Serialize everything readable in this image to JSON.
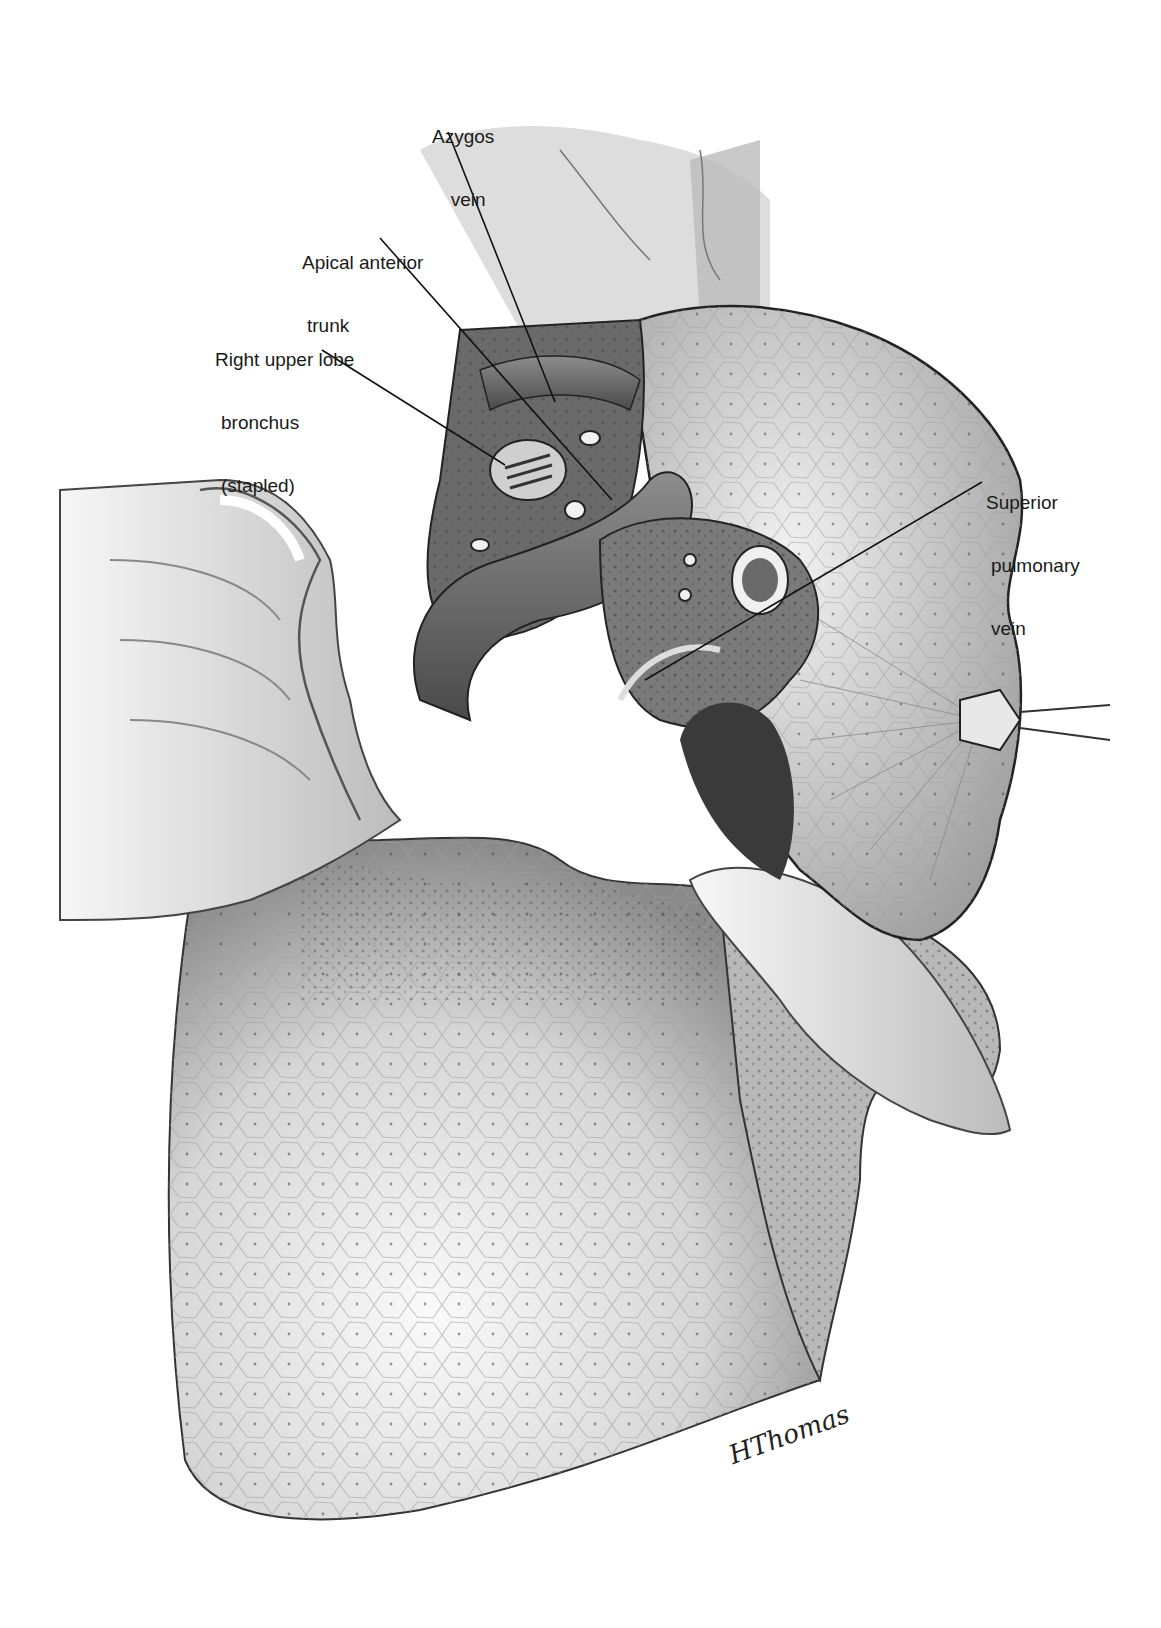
{
  "figure": {
    "type": "surgical illustration",
    "labels": [
      {
        "id": "azygos",
        "lines": [
          "Azygos",
          "vein"
        ]
      },
      {
        "id": "apical",
        "lines": [
          "Apical anterior",
          "trunk"
        ]
      },
      {
        "id": "bronchus",
        "lines": [
          "Right upper lobe",
          "bronchus",
          "(stapled)"
        ]
      },
      {
        "id": "spv",
        "lines": [
          "Superior",
          "pulmonary",
          "vein"
        ]
      }
    ],
    "signature": "HThomas"
  },
  "colors": {
    "background": "#ffffff",
    "ink": "#1a1a1a",
    "tissue_light": "#d8d8d8",
    "tissue_mid": "#9a9a9a",
    "tissue_dark": "#4a4a4a"
  }
}
